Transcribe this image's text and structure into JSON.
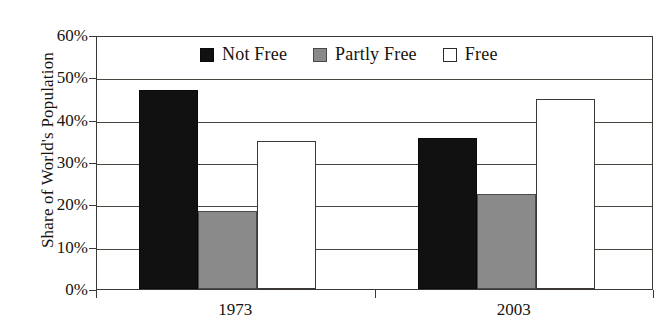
{
  "chart_data": {
    "type": "bar",
    "title": "",
    "xlabel": "",
    "ylabel": "Share of World's Population",
    "categories": [
      "1973",
      "2003"
    ],
    "ylim": [
      0,
      60
    ],
    "ytick_labels": [
      "0%",
      "10%",
      "20%",
      "30%",
      "40%",
      "50%",
      "60%"
    ],
    "ytick_values": [
      0,
      10,
      20,
      30,
      40,
      50,
      60
    ],
    "grid": true,
    "legend_position": "top-center",
    "series": [
      {
        "name": "Not Free",
        "color": "#111111",
        "values": [
          47,
          35.7
        ]
      },
      {
        "name": "Partly Free",
        "color": "#8a8a8a",
        "values": [
          18.5,
          22.5
        ]
      },
      {
        "name": "Free",
        "color": "#ffffff",
        "values": [
          35,
          45
        ]
      }
    ]
  },
  "axes": {
    "y_title": "Share of World's Population",
    "y_ticks": [
      {
        "label": "60%",
        "value": 60
      },
      {
        "label": "50%",
        "value": 50
      },
      {
        "label": "40%",
        "value": 40
      },
      {
        "label": "30%",
        "value": 30
      },
      {
        "label": "20%",
        "value": 20
      },
      {
        "label": "10%",
        "value": 10
      },
      {
        "label": "0%",
        "value": 0
      }
    ],
    "x_ticks": [
      {
        "label": "1973"
      },
      {
        "label": "2003"
      }
    ]
  },
  "legend": {
    "items": [
      {
        "label": "Not Free",
        "swatch": "black-square-icon"
      },
      {
        "label": "Partly Free",
        "swatch": "gray-square-icon"
      },
      {
        "label": "Free",
        "swatch": "white-square-icon"
      }
    ]
  }
}
